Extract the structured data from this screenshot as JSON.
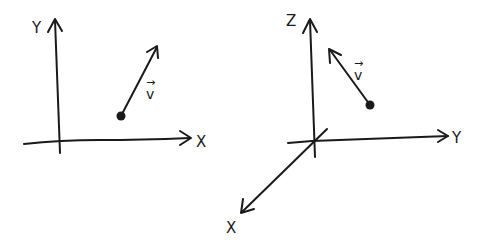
{
  "diagrams": [
    {
      "name": "2D coordinate system",
      "axes": {
        "x": {
          "label": "X"
        },
        "y": {
          "label": "Y"
        }
      },
      "vector": {
        "label": "v",
        "accent": "→",
        "has_origin_point": true,
        "direction": "up-right"
      }
    },
    {
      "name": "3D coordinate system",
      "axes": {
        "x": {
          "label": "X"
        },
        "y": {
          "label": "Y"
        },
        "z": {
          "label": "Z"
        }
      },
      "vector": {
        "label": "v",
        "accent": "→",
        "has_origin_point": true,
        "direction": "up-left"
      }
    }
  ],
  "colors": {
    "ink": "#1a1a1a",
    "background": "#ffffff"
  }
}
